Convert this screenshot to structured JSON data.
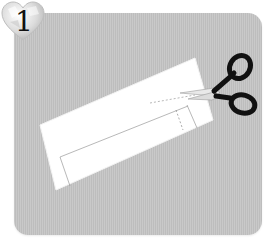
{
  "step": {
    "number": "1",
    "badge_shape": "heart-icon"
  },
  "illustration": {
    "subject": "paper strip being cut with scissors",
    "items": [
      "paper-strip-icon",
      "dashed-fold-lines",
      "scissors-icon"
    ]
  },
  "colors": {
    "panel_background": "#c4c4c4",
    "paper": "#ffffff",
    "scissors_handle": "#111111",
    "scissors_blade": "#e8e8e8",
    "number_text": "#111111"
  }
}
